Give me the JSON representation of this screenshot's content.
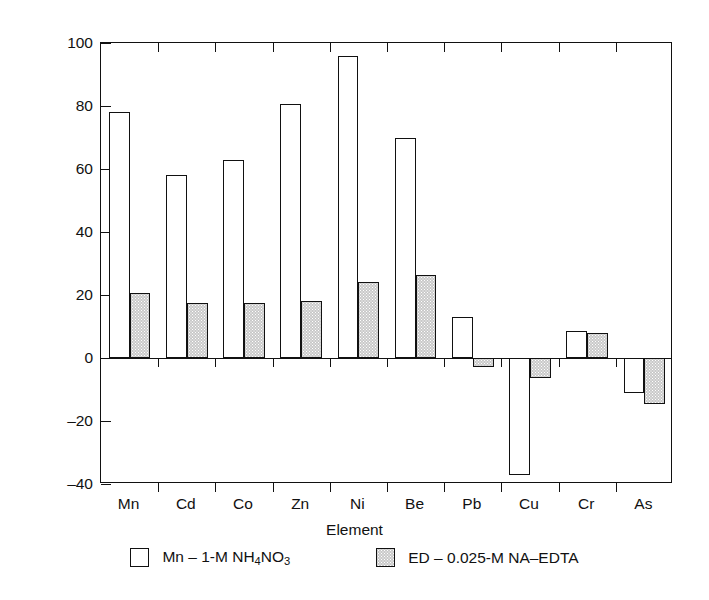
{
  "chart_data": {
    "type": "bar",
    "title": "",
    "xlabel": "Element",
    "ylabel": "% Limed/Unlimed × 100",
    "ylim": [
      -40,
      100
    ],
    "yticks": [
      100,
      80,
      60,
      40,
      20,
      0,
      -20,
      -40
    ],
    "ytick_labels": [
      "100",
      "80",
      "60",
      "40",
      "20",
      "0",
      "–20",
      "–40"
    ],
    "grid": false,
    "legend_position": "bottom",
    "categories": [
      "Mn",
      "Cd",
      "Co",
      "Zn",
      "Ni",
      "Be",
      "Pb",
      "Cu",
      "Cr",
      "As"
    ],
    "series": [
      {
        "name": "Mn – 1-M NH4NO3",
        "legend_label_parts": [
          "Mn – 1-M NH",
          "4",
          "NO",
          "3"
        ],
        "fill": "white",
        "values": [
          78,
          58,
          63,
          80.5,
          96,
          70,
          13,
          -37,
          8.5,
          -11
        ]
      },
      {
        "name": "ED – 0.025-M NA–EDTA",
        "legend_label_parts": [
          "ED – 0.025-M NA–EDTA"
        ],
        "fill": "gray",
        "values": [
          20.5,
          17.5,
          17.5,
          18,
          24,
          26.5,
          -3,
          -6.5,
          8,
          -14.5
        ]
      }
    ]
  },
  "legend": {
    "entries": [
      {
        "swatch": "white",
        "label": "Mn – 1-M NH4NO3"
      },
      {
        "swatch": "gray",
        "label": "ED – 0.025-M NA–EDTA"
      }
    ]
  },
  "colors": {
    "axis": "#111111",
    "series_white_fill": "#ffffff",
    "series_gray_fill": "#c9c9c9",
    "background": "#ffffff"
  }
}
